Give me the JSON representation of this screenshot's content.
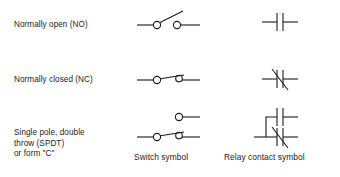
{
  "figure": {
    "background_color": "#ffffff",
    "stroke_color": "#1a1a1a",
    "text_color": "#1d1d1d"
  },
  "columns": {
    "switch_caption": "Switch symbol",
    "relay_caption": "Relay contact symbol"
  },
  "rows": [
    {
      "id": "normally-open",
      "label": "Normally open (NO)",
      "switch_symbol": "open-blade-switch",
      "relay_symbol": "parallel-bars-no-contact"
    },
    {
      "id": "normally-closed",
      "label": "Normally closed (NC)",
      "switch_symbol": "closed-blade-switch",
      "relay_symbol": "parallel-bars-with-slash-nc-contact"
    },
    {
      "id": "single-pole-double-throw",
      "label": "Single pole, double\nthrow (SPDT)\nor form \"C\"",
      "switch_symbol": "changeover-blade-switch",
      "relay_symbol": "stacked-no-and-nc-contacts"
    }
  ]
}
